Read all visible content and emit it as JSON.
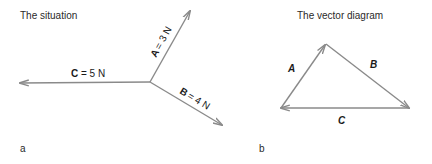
{
  "panel_a": {
    "title": "The situation",
    "label": "a",
    "vectors": [
      {
        "name": "A",
        "magnitude_label": "= 3 N"
      },
      {
        "name": "B",
        "magnitude_label": "= 4 N"
      },
      {
        "name": "C",
        "magnitude_label": "= 5 N"
      }
    ]
  },
  "panel_b": {
    "title": "The vector diagram",
    "label": "b",
    "vectors": [
      {
        "name": "A"
      },
      {
        "name": "B"
      },
      {
        "name": "C"
      }
    ]
  },
  "colors": {
    "line": "#8a8a8a",
    "text": "#1a1a1a"
  }
}
